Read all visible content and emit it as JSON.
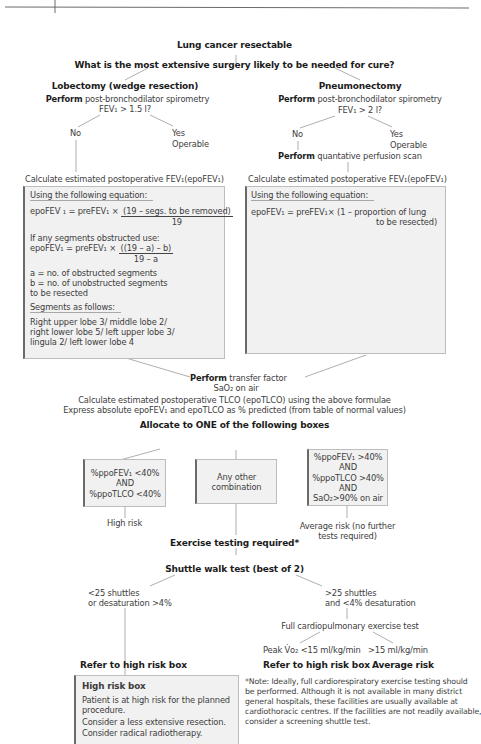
{
  "header": {
    "page_marker": ""
  },
  "root": {
    "title": "Lung cancer resectable",
    "question": "What is the most extensive surgery likely to be needed for cure?"
  },
  "lobectomy": {
    "title": "Lobectomy (wedge resection)",
    "perform_bold": "Perform",
    "perform_rest": "post-bronchodilator spirometry",
    "criterion": "FEV₁ > 1.5 l?",
    "no": "No",
    "yes": "Yes",
    "operable": "Operable",
    "calc": "Calculate estimated postoperative FEV₁(epoFEV₁)",
    "box": {
      "heading": "Using the following equation:",
      "eq1_lhs": "epoFEV ₁ = preFEV₁ ×",
      "eq1_num": "(19 – segs. to be removed)",
      "eq1_den": "19",
      "obstructed_intro": "If any segments obstructed use:",
      "eq2_lhs": "epoFEV₁ = preFEV₁ ×",
      "eq2_num": "((19 – a) – b)",
      "eq2_den": "19 – a",
      "def_a": "a = no. of obstructed segments",
      "def_b1": "b = no. of unobstructed segments",
      "def_b2": "to be resected",
      "segments_heading": "Segments as follows:",
      "segments_lines": [
        "Right upper lobe 3/ middle lobe 2/",
        "right lower lobe 5/ left upper lobe 3/",
        "lingula 2/ left lower lobe 4"
      ]
    }
  },
  "pneumonectomy": {
    "title": "Pneumonectomy",
    "perform_bold": "Perform",
    "perform_rest": "post-bronchodilator spirometry",
    "criterion": "FEV₁ > 2 l?",
    "no": "No",
    "yes": "Yes",
    "operable": "Operable",
    "scan_bold": "Perform",
    "scan_rest": "quantative perfusion scan",
    "calc": "Calculate estimated postoperative FEV₁(epoFEV₁)",
    "box": {
      "heading": "Using the following equation:",
      "eq_line1": "epoFEV₁ = preFEV₁× (1 – proportion of lung",
      "eq_line2": "to be resected)"
    }
  },
  "transfer": {
    "perform_bold": "Perform",
    "perform_rest": "transfer factor",
    "sao2": "SaO₂ on air",
    "calc_tlco": "Calculate estimated postoperative TLCO (epoTLCO) using the above formulae",
    "express": "Express absolute epoFEV₁ and epoTLCO as % predicted (from table of normal values)"
  },
  "allocate": {
    "title": "Allocate to ONE of the following boxes",
    "boxes": [
      {
        "lines": [
          "%ppoFEV₁ <40%",
          "AND",
          "%ppoTLCO <40%"
        ],
        "outcome": [
          "High risk"
        ]
      },
      {
        "lines": [
          "Any other",
          "combination"
        ],
        "outcome": []
      },
      {
        "lines": [
          "%ppoFEV₁ >40%",
          "AND",
          "%ppoTLCO >40%",
          "AND",
          "SaO₂>90% on air"
        ],
        "outcome": [
          "Average risk (no further",
          "tests required)"
        ]
      }
    ]
  },
  "exercise": {
    "title": "Exercise testing required*",
    "shuttle": "Shuttle walk test (best of 2)",
    "left_branch": [
      "<25 shuttles",
      "or desaturation >4%"
    ],
    "right_branch": [
      ">25 shuttles",
      "and <4% desaturation"
    ],
    "cpet": "Full cardiopulmonary exercise test",
    "peak_low": "Peak V̇o₂ <15 ml/kg/min",
    "peak_high": ">15 ml/kg/min",
    "refer_left": "Refer to high risk box",
    "refer_mid": "Refer to high risk box",
    "average_risk": "Average risk"
  },
  "high_risk_box": {
    "title": "High risk box",
    "lines": [
      "Patient is at high risk for the planned",
      "procedure.",
      "Consider a less extensive resection.",
      "Consider radical radiotherapy."
    ]
  },
  "note": {
    "lines": [
      "*Note: Ideally, full cardiorespiratory exercise testing should",
      "be performed. Although it is not available in many district",
      "general hospitals, these facilities are usually available at",
      "cardiothoracic centres. If the facilities are not readily available,",
      "consider a screening shuttle test."
    ]
  },
  "colors": {
    "box_fill": "#f1f1f1",
    "box_left_border": "#6a6a6a",
    "connector": "#9a9a9a",
    "text": "#3d3d3d",
    "bold_text": "#1c1c1c"
  }
}
